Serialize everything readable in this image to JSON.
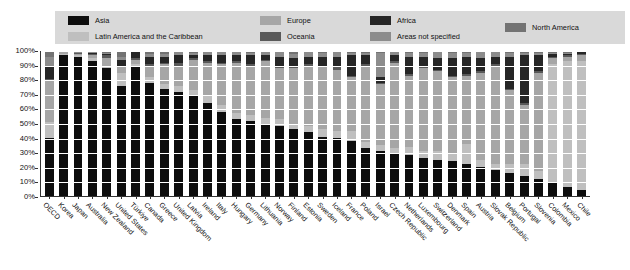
{
  "legend": {
    "background_color": "#d9d9d9",
    "columns": [
      {
        "left": 13,
        "items": [
          {
            "label": "Asia",
            "color": "#0d0d0d"
          },
          {
            "label": "Latin America and the Caribbean",
            "color": "#bfbfbf"
          }
        ]
      },
      {
        "left": 205,
        "items": [
          {
            "label": "Europe",
            "color": "#a6a6a6"
          },
          {
            "label": "Oceania",
            "color": "#595959"
          }
        ]
      },
      {
        "left": 315,
        "items": [
          {
            "label": "Africa",
            "color": "#262626"
          },
          {
            "label": "Areas not specified",
            "color": "#8c8c8c"
          }
        ]
      },
      {
        "left": 450,
        "items": [
          {
            "label": "North America",
            "color": "#737373"
          }
        ]
      }
    ]
  },
  "chart_data": {
    "type": "bar",
    "subtype": "stacked-100-percent",
    "title": "",
    "xlabel": "",
    "ylabel": "",
    "ylim": [
      0,
      100
    ],
    "grid": true,
    "legend_position": "top",
    "ytick_labels": [
      "100%",
      "90%",
      "80%",
      "70%",
      "60%",
      "50%",
      "40%",
      "30%",
      "20%",
      "10%",
      "0%"
    ],
    "ytick_values": [
      100,
      90,
      80,
      70,
      60,
      50,
      40,
      30,
      20,
      10,
      0
    ],
    "series_order": [
      "Asia",
      "Latin America and the Caribbean",
      "Europe",
      "Oceania",
      "Africa",
      "Areas not specified",
      "North America"
    ],
    "series_colors": {
      "Asia": "#0d0d0d",
      "Latin America and the Caribbean": "#bfbfbf",
      "Europe": "#a6a6a6",
      "Oceania": "#595959",
      "Africa": "#262626",
      "Areas not specified": "#8c8c8c",
      "North America": "#737373"
    },
    "categories": [
      "OECD",
      "Korea",
      "Japan",
      "Australia",
      "New Zealand",
      "United States",
      "Türkiye",
      "Canada",
      "Greece",
      "United Kingdom",
      "Latvia",
      "Ireland",
      "Italy",
      "Hungary",
      "Germany",
      "Lithuania",
      "Norway",
      "Finland",
      "Estonia",
      "Sweden",
      "Iceland",
      "France",
      "Poland",
      "Israel",
      "Czech Republic",
      "Netherlands",
      "Luxembourg",
      "Switzerland",
      "Denmark",
      "Spain",
      "Austria",
      "Slovak Republic",
      "Belgium",
      "Portugal",
      "Slovenia",
      "Colombia",
      "Mexico",
      "Chile"
    ],
    "series": [
      {
        "name": "Asia",
        "values": [
          40,
          97,
          96,
          93,
          88,
          76,
          90,
          78,
          74,
          72,
          69,
          64,
          58,
          53,
          52,
          50,
          48,
          46,
          44,
          41,
          40,
          38,
          33,
          31,
          29,
          28,
          26,
          25,
          24,
          22,
          20,
          18,
          16,
          14,
          12,
          9,
          6,
          4
        ]
      },
      {
        "name": "Latin America and the Caribbean",
        "values": [
          11,
          1,
          1,
          2,
          2,
          9,
          1,
          4,
          3,
          4,
          4,
          5,
          5,
          4,
          4,
          4,
          5,
          4,
          4,
          5,
          5,
          7,
          4,
          4,
          4,
          6,
          5,
          6,
          6,
          14,
          5,
          4,
          6,
          8,
          5,
          82,
          87,
          89
        ]
      },
      {
        "name": "Europe",
        "values": [
          28,
          1,
          1,
          2,
          5,
          4,
          3,
          8,
          14,
          14,
          21,
          23,
          28,
          35,
          34,
          39,
          35,
          38,
          42,
          43,
          42,
          37,
          53,
          42,
          59,
          49,
          57,
          55,
          52,
          47,
          60,
          68,
          51,
          41,
          68,
          4,
          3,
          4
        ]
      },
      {
        "name": "Oceania",
        "values": [
          2,
          0,
          1,
          1,
          2,
          1,
          1,
          1,
          1,
          2,
          1,
          1,
          1,
          1,
          1,
          1,
          1,
          1,
          1,
          1,
          2,
          1,
          1,
          1,
          1,
          1,
          1,
          1,
          1,
          1,
          1,
          1,
          1,
          1,
          1,
          1,
          1,
          1
        ]
      },
      {
        "name": "Africa",
        "values": [
          9,
          0,
          0,
          1,
          1,
          4,
          4,
          5,
          4,
          5,
          2,
          4,
          5,
          4,
          6,
          3,
          7,
          6,
          5,
          6,
          7,
          14,
          6,
          4,
          4,
          12,
          7,
          8,
          12,
          12,
          9,
          5,
          22,
          33,
          11,
          2,
          1,
          1
        ]
      },
      {
        "name": "Areas not specified",
        "values": [
          6,
          1,
          1,
          1,
          1,
          2,
          1,
          2,
          2,
          2,
          2,
          2,
          2,
          2,
          2,
          2,
          3,
          3,
          3,
          3,
          3,
          2,
          2,
          17,
          2,
          3,
          3,
          4,
          4,
          3,
          4,
          3,
          3,
          2,
          2,
          1,
          1,
          1
        ]
      },
      {
        "name": "North America",
        "values": [
          4,
          0,
          0,
          0,
          1,
          4,
          0,
          2,
          2,
          1,
          1,
          1,
          1,
          1,
          1,
          1,
          1,
          2,
          1,
          1,
          1,
          1,
          1,
          1,
          1,
          1,
          1,
          1,
          1,
          1,
          1,
          1,
          1,
          1,
          1,
          1,
          1,
          0
        ]
      }
    ]
  }
}
